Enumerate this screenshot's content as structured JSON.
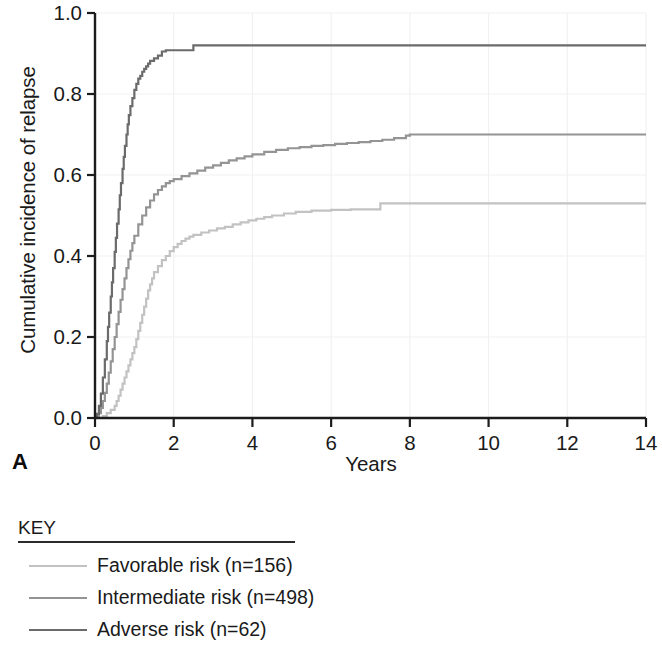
{
  "figure": {
    "panel_label": "A"
  },
  "key": {
    "title": "KEY",
    "items": [
      {
        "label": "Favorable risk (n=156)",
        "color": "#c2c2c2"
      },
      {
        "label": "Intermediate risk (n=498)",
        "color": "#949494"
      },
      {
        "label": "Adverse risk (n=62)",
        "color": "#6b6b6b"
      }
    ]
  },
  "chart_data": {
    "type": "line",
    "title": "",
    "xlabel": "Years",
    "ylabel": "Cumulative incidence of relapse",
    "xlim": [
      0,
      14
    ],
    "ylim": [
      0,
      1.0
    ],
    "xticks": [
      0,
      2,
      4,
      6,
      8,
      10,
      12,
      14
    ],
    "xtick_labels": [
      "0",
      "2",
      "4",
      "6",
      "8",
      "10",
      "12",
      "14"
    ],
    "yticks": [
      0.0,
      0.2,
      0.4,
      0.6,
      0.8,
      1.0
    ],
    "ytick_labels": [
      "0.0",
      "0.2",
      "0.4",
      "0.6",
      "0.8",
      "1.0"
    ],
    "grid": true,
    "legend_position": "below-left",
    "series": [
      {
        "name": "Favorable risk (n=156)",
        "n": 156,
        "color": "#c2c2c2",
        "plateau": 0.53,
        "points": [
          [
            0.0,
            0.0
          ],
          [
            0.1,
            0.0
          ],
          [
            0.2,
            0.005
          ],
          [
            0.3,
            0.012
          ],
          [
            0.4,
            0.02
          ],
          [
            0.5,
            0.03
          ],
          [
            0.55,
            0.042
          ],
          [
            0.6,
            0.055
          ],
          [
            0.65,
            0.07
          ],
          [
            0.7,
            0.085
          ],
          [
            0.75,
            0.1
          ],
          [
            0.8,
            0.115
          ],
          [
            0.85,
            0.13
          ],
          [
            0.9,
            0.145
          ],
          [
            0.95,
            0.16
          ],
          [
            1.0,
            0.175
          ],
          [
            1.05,
            0.195
          ],
          [
            1.1,
            0.215
          ],
          [
            1.15,
            0.235
          ],
          [
            1.2,
            0.255
          ],
          [
            1.25,
            0.275
          ],
          [
            1.3,
            0.295
          ],
          [
            1.35,
            0.315
          ],
          [
            1.4,
            0.33
          ],
          [
            1.45,
            0.345
          ],
          [
            1.5,
            0.36
          ],
          [
            1.6,
            0.375
          ],
          [
            1.7,
            0.39
          ],
          [
            1.8,
            0.4
          ],
          [
            1.9,
            0.412
          ],
          [
            2.0,
            0.422
          ],
          [
            2.1,
            0.43
          ],
          [
            2.2,
            0.437
          ],
          [
            2.3,
            0.443
          ],
          [
            2.4,
            0.448
          ],
          [
            2.5,
            0.452
          ],
          [
            2.7,
            0.458
          ],
          [
            2.9,
            0.463
          ],
          [
            3.1,
            0.468
          ],
          [
            3.3,
            0.472
          ],
          [
            3.5,
            0.478
          ],
          [
            3.7,
            0.483
          ],
          [
            3.9,
            0.488
          ],
          [
            4.1,
            0.492
          ],
          [
            4.3,
            0.496
          ],
          [
            4.5,
            0.5
          ],
          [
            4.8,
            0.505
          ],
          [
            5.1,
            0.509
          ],
          [
            5.5,
            0.512
          ],
          [
            6.0,
            0.514
          ],
          [
            6.5,
            0.515
          ],
          [
            7.0,
            0.515
          ],
          [
            7.2,
            0.515
          ],
          [
            7.25,
            0.53
          ],
          [
            8.0,
            0.53
          ],
          [
            10.0,
            0.53
          ],
          [
            12.0,
            0.53
          ],
          [
            14.0,
            0.53
          ]
        ]
      },
      {
        "name": "Intermediate risk (n=498)",
        "n": 498,
        "color": "#949494",
        "plateau": 0.7,
        "points": [
          [
            0.0,
            0.0
          ],
          [
            0.05,
            0.004
          ],
          [
            0.1,
            0.012
          ],
          [
            0.15,
            0.025
          ],
          [
            0.2,
            0.042
          ],
          [
            0.25,
            0.062
          ],
          [
            0.3,
            0.085
          ],
          [
            0.35,
            0.112
          ],
          [
            0.4,
            0.14
          ],
          [
            0.45,
            0.17
          ],
          [
            0.5,
            0.2
          ],
          [
            0.55,
            0.232
          ],
          [
            0.6,
            0.262
          ],
          [
            0.65,
            0.292
          ],
          [
            0.7,
            0.318
          ],
          [
            0.75,
            0.345
          ],
          [
            0.8,
            0.37
          ],
          [
            0.85,
            0.392
          ],
          [
            0.9,
            0.413
          ],
          [
            0.95,
            0.432
          ],
          [
            1.0,
            0.45
          ],
          [
            1.1,
            0.478
          ],
          [
            1.2,
            0.5
          ],
          [
            1.3,
            0.52
          ],
          [
            1.4,
            0.537
          ],
          [
            1.5,
            0.552
          ],
          [
            1.6,
            0.563
          ],
          [
            1.7,
            0.572
          ],
          [
            1.8,
            0.58
          ],
          [
            1.9,
            0.585
          ],
          [
            2.0,
            0.59
          ],
          [
            2.2,
            0.597
          ],
          [
            2.4,
            0.604
          ],
          [
            2.6,
            0.611
          ],
          [
            2.8,
            0.618
          ],
          [
            3.0,
            0.624
          ],
          [
            3.2,
            0.63
          ],
          [
            3.4,
            0.636
          ],
          [
            3.6,
            0.641
          ],
          [
            3.8,
            0.646
          ],
          [
            4.0,
            0.651
          ],
          [
            4.3,
            0.657
          ],
          [
            4.6,
            0.662
          ],
          [
            4.9,
            0.666
          ],
          [
            5.2,
            0.669
          ],
          [
            5.5,
            0.672
          ],
          [
            5.8,
            0.674
          ],
          [
            6.1,
            0.677
          ],
          [
            6.4,
            0.679
          ],
          [
            6.7,
            0.681
          ],
          [
            7.0,
            0.684
          ],
          [
            7.3,
            0.687
          ],
          [
            7.6,
            0.691
          ],
          [
            7.9,
            0.697
          ],
          [
            8.0,
            0.7
          ],
          [
            9.0,
            0.7
          ],
          [
            10.0,
            0.7
          ],
          [
            12.0,
            0.7
          ],
          [
            14.0,
            0.7
          ]
        ]
      },
      {
        "name": "Adverse risk (n=62)",
        "n": 62,
        "color": "#6b6b6b",
        "plateau": 0.92,
        "points": [
          [
            0.0,
            0.0
          ],
          [
            0.05,
            0.01
          ],
          [
            0.1,
            0.03
          ],
          [
            0.15,
            0.06
          ],
          [
            0.2,
            0.1
          ],
          [
            0.25,
            0.145
          ],
          [
            0.3,
            0.19
          ],
          [
            0.33,
            0.225
          ],
          [
            0.36,
            0.26
          ],
          [
            0.4,
            0.3
          ],
          [
            0.43,
            0.335
          ],
          [
            0.46,
            0.37
          ],
          [
            0.5,
            0.41
          ],
          [
            0.53,
            0.445
          ],
          [
            0.56,
            0.48
          ],
          [
            0.6,
            0.515
          ],
          [
            0.63,
            0.55
          ],
          [
            0.66,
            0.58
          ],
          [
            0.7,
            0.615
          ],
          [
            0.73,
            0.645
          ],
          [
            0.76,
            0.672
          ],
          [
            0.8,
            0.7
          ],
          [
            0.83,
            0.725
          ],
          [
            0.86,
            0.748
          ],
          [
            0.9,
            0.77
          ],
          [
            0.95,
            0.79
          ],
          [
            1.0,
            0.81
          ],
          [
            1.05,
            0.825
          ],
          [
            1.1,
            0.838
          ],
          [
            1.15,
            0.845
          ],
          [
            1.2,
            0.855
          ],
          [
            1.25,
            0.862
          ],
          [
            1.3,
            0.868
          ],
          [
            1.35,
            0.875
          ],
          [
            1.4,
            0.882
          ],
          [
            1.5,
            0.888
          ],
          [
            1.6,
            0.895
          ],
          [
            1.7,
            0.905
          ],
          [
            1.8,
            0.908
          ],
          [
            2.0,
            0.908
          ],
          [
            2.3,
            0.908
          ],
          [
            2.45,
            0.908
          ],
          [
            2.5,
            0.92
          ],
          [
            3.0,
            0.92
          ],
          [
            5.0,
            0.92
          ],
          [
            8.0,
            0.92
          ],
          [
            11.0,
            0.92
          ],
          [
            14.0,
            0.92
          ]
        ]
      }
    ]
  }
}
